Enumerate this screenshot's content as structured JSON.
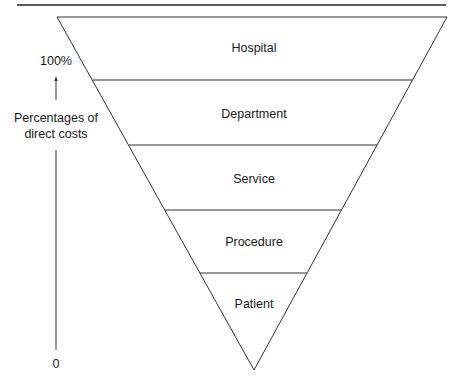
{
  "diagram": {
    "type": "inverted-pyramid",
    "levels": [
      {
        "label": "Hospital"
      },
      {
        "label": "Department"
      },
      {
        "label": "Service"
      },
      {
        "label": "Procedure"
      },
      {
        "label": "Patient"
      }
    ],
    "axis": {
      "top_label": "100%",
      "title_line1": "Percentages of",
      "title_line2": "direct costs",
      "bottom_label": "0"
    }
  }
}
